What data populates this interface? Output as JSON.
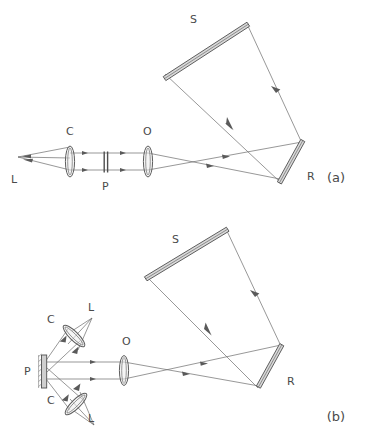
{
  "figure": {
    "background_color": "#ffffff",
    "line_color": "#6b6b6b",
    "mirror_fill": "#d9d9d9",
    "label_color": "#4a4a4a",
    "width": 380,
    "height": 438
  },
  "panels": [
    {
      "id": "a",
      "caption": "(a)",
      "caption_x": 336,
      "caption_y": 182,
      "components": [
        {
          "key": "L",
          "name": "light-source",
          "label": "L",
          "x": 11,
          "y": 183
        },
        {
          "key": "C",
          "name": "collimating-lens",
          "label": "C",
          "x": 66,
          "y": 135
        },
        {
          "key": "P",
          "name": "beam-splitter-plate",
          "label": "P",
          "x": 102,
          "y": 190
        },
        {
          "key": "O",
          "name": "objective-lens",
          "label": "O",
          "x": 143,
          "y": 135
        },
        {
          "key": "S",
          "name": "mirror-s",
          "label": "S",
          "x": 190,
          "y": 23
        },
        {
          "key": "R",
          "name": "mirror-r",
          "label": "R",
          "x": 307,
          "y": 180
        }
      ]
    },
    {
      "id": "b",
      "caption": "(b)",
      "caption_x": 336,
      "caption_y": 421,
      "components": [
        {
          "key": "L-top",
          "name": "light-source-upper",
          "label": "L",
          "x": 88,
          "y": 311
        },
        {
          "key": "C-top",
          "name": "collimating-lens-upper",
          "label": "C",
          "x": 47,
          "y": 323
        },
        {
          "key": "P",
          "name": "screen-plate",
          "label": "P",
          "x": 24,
          "y": 375
        },
        {
          "key": "C-bottom",
          "name": "collimating-lens-lower",
          "label": "C",
          "x": 47,
          "y": 404
        },
        {
          "key": "L-bottom",
          "name": "light-source-lower",
          "label": "L",
          "x": 88,
          "y": 422
        },
        {
          "key": "O",
          "name": "objective-lens",
          "label": "O",
          "x": 122,
          "y": 345
        },
        {
          "key": "S",
          "name": "mirror-s",
          "label": "S",
          "x": 172,
          "y": 243
        },
        {
          "key": "R",
          "name": "mirror-r",
          "label": "R",
          "x": 287,
          "y": 385
        }
      ]
    }
  ]
}
